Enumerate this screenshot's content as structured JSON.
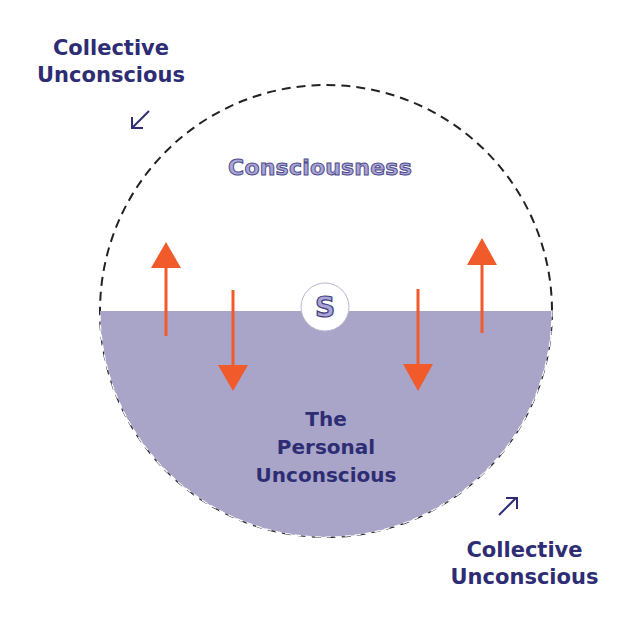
{
  "diagram": {
    "labels": {
      "collective_top": [
        "Collective",
        "Unconscious"
      ],
      "consciousness": "Consciousness",
      "self": "S",
      "personal": [
        "The",
        "Personal",
        "Unconscious"
      ],
      "collective_bottom": [
        "Collective",
        "Unconscious"
      ]
    },
    "arrows": [
      {
        "name": "arrow-up-left",
        "direction": "up"
      },
      {
        "name": "arrow-down-left",
        "direction": "down"
      },
      {
        "name": "arrow-down-right",
        "direction": "down"
      },
      {
        "name": "arrow-up-right",
        "direction": "up"
      }
    ],
    "colors": {
      "text": "#2e2d74",
      "unconscious_fill": "#a9a5c9",
      "arrow": "#f15a2b",
      "boundary": "#222222"
    }
  }
}
